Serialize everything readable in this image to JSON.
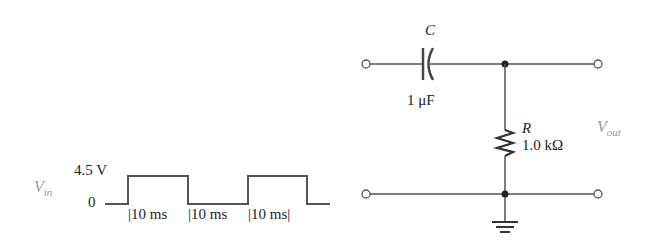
{
  "waveform": {
    "signal_label": "V",
    "signal_sub": "in",
    "high_level": "4.5 V",
    "low_level": "0",
    "intervals": [
      "|10 ms",
      "|10 ms",
      "|10 ms|"
    ]
  },
  "circuit": {
    "capacitor": {
      "name": "C",
      "value": "1 μF"
    },
    "resistor": {
      "name": "R",
      "value": "1.0 kΩ"
    },
    "output_label": "V",
    "output_sub": "out"
  },
  "colors": {
    "line": "#555555",
    "label_gray": "#9a9a9a"
  }
}
